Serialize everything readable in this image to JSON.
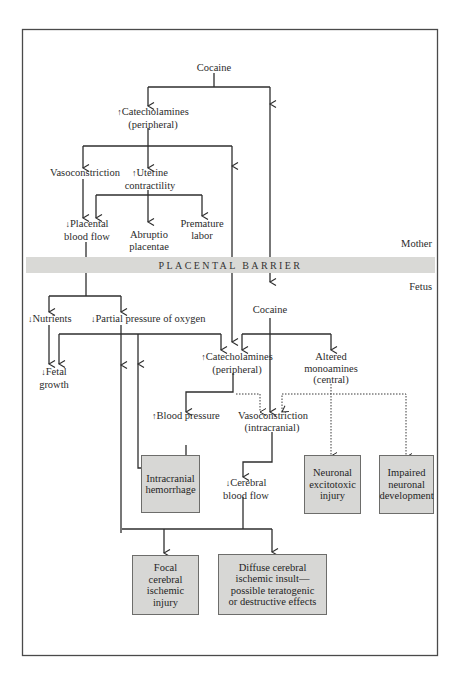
{
  "frame": {
    "border_color": "#4a4a4a"
  },
  "regions": {
    "mother_label": "Mother",
    "fetus_label": "Fetus"
  },
  "barrier": {
    "label": "PLACENTAL BARRIER",
    "color": "#d9d9d6"
  },
  "nodes": {
    "cocaine_mother": "Cocaine",
    "catecholamines_mother_arrow": "↑",
    "catecholamines_mother_l1": "Catecholamines",
    "catecholamines_mother_l2": "(peripheral)",
    "vasoconstriction_mother": "Vasoconstriction",
    "uterine_arrow": "↑",
    "uterine_l1": "Uterine",
    "uterine_l2": "contractility",
    "placental_arrow": "↓",
    "placental_l1": "Placental",
    "placental_l2": "blood flow",
    "abruptio_l1": "Abruptio",
    "abruptio_l2": "placentae",
    "premature_l1": "Premature",
    "premature_l2": "labor",
    "nutrients_arrow": "↓",
    "nutrients": "Nutrients",
    "oxygen_arrow": "↓",
    "oxygen": "Partial pressure of oxygen",
    "cocaine_fetus": "Cocaine",
    "fetal_growth_arrow": "↓",
    "fetal_growth_l1": "Fetal",
    "fetal_growth_l2": "growth",
    "catecholamines_fetus_arrow": "↑",
    "catecholamines_fetus_l1": "Catecholamines",
    "catecholamines_fetus_l2": "(peripheral)",
    "monoamines_l1": "Altered",
    "monoamines_l2": "monoamines",
    "monoamines_l3": "(central)",
    "blood_pressure_arrow": "↑",
    "blood_pressure": "Blood pressure",
    "vasoconstriction_fetus_l1": "Vasoconstriction",
    "vasoconstriction_fetus_l2": "(intracranial)",
    "cerebral_arrow": "↓",
    "cerebral_l1": "Cerebral",
    "cerebral_l2": "blood flow"
  },
  "outcomes": {
    "intracranial_hemorrhage": "Intracranial\nhemorrhage",
    "neuronal_excitotoxic": "Neuronal\nexcitotoxic\ninjury",
    "impaired_development": "Impaired\nneuronal\ndevelopment",
    "focal_ischemic": "Focal\ncerebral\nischemic\ninjury",
    "diffuse_ischemic": "Diffuse cerebral\nischemic insult—\npossible teratogenic\nor destructive effects"
  },
  "colors": {
    "outcome_box_fill": "#d7d7d5",
    "line": "#2e2e2e"
  }
}
